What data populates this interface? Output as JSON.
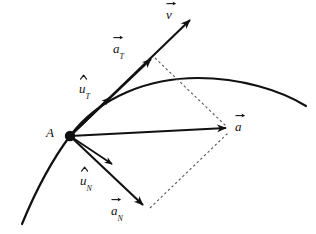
{
  "figure": {
    "background_color": "#ffffff",
    "stroke_color": "#111111",
    "dashed_color": "#555555",
    "width": 316,
    "height": 234
  },
  "labels": {
    "point_a": "A",
    "velocity": "v",
    "accel_total": "a",
    "accel_tangential_base": "a",
    "accel_tangential_sub": "T",
    "accel_normal_base": "a",
    "accel_normal_sub": "N",
    "unit_tangential_base": "u",
    "unit_tangential_sub": "T",
    "unit_normal_base": "u",
    "unit_normal_sub": "N"
  },
  "geometry": {
    "point_a": {
      "x": 70,
      "y": 136
    },
    "velocity_vector": {
      "x1": 70,
      "y1": 136,
      "x2": 192,
      "y2": 18
    },
    "accel_tangential_vector": {
      "x1": 70,
      "y1": 136,
      "x2": 153,
      "y2": 57
    },
    "unit_tangential_vector": {
      "x1": 70,
      "y1": 136,
      "x2": 111,
      "y2": 96
    },
    "accel_total_vector": {
      "x1": 70,
      "y1": 136,
      "x2": 228,
      "y2": 128
    },
    "unit_normal_vector": {
      "x1": 70,
      "y1": 136,
      "x2": 114,
      "y2": 166
    },
    "accel_normal_vector": {
      "x1": 70,
      "y1": 136,
      "x2": 145,
      "y2": 207
    },
    "dashed_from_tangential": {
      "x1": 155,
      "y1": 58,
      "x2": 226,
      "y2": 126
    },
    "dashed_from_normal": {
      "x1": 150,
      "y1": 208,
      "x2": 228,
      "y2": 133
    },
    "curve_path": "M 22 224 C 36 190, 52 160, 70 136 C 100 96, 150 78, 198 78 C 240 78, 280 90, 306 106"
  },
  "label_positions": {
    "point_a": {
      "left": 46,
      "top": 126
    },
    "velocity": {
      "left": 166,
      "top": 6
    },
    "accel_tangential": {
      "left": 113,
      "top": 40
    },
    "unit_tangential": {
      "left": 79,
      "top": 80
    },
    "accel_total": {
      "left": 235,
      "top": 118
    },
    "unit_normal": {
      "left": 80,
      "top": 172
    },
    "accel_normal": {
      "left": 111,
      "top": 202
    }
  }
}
